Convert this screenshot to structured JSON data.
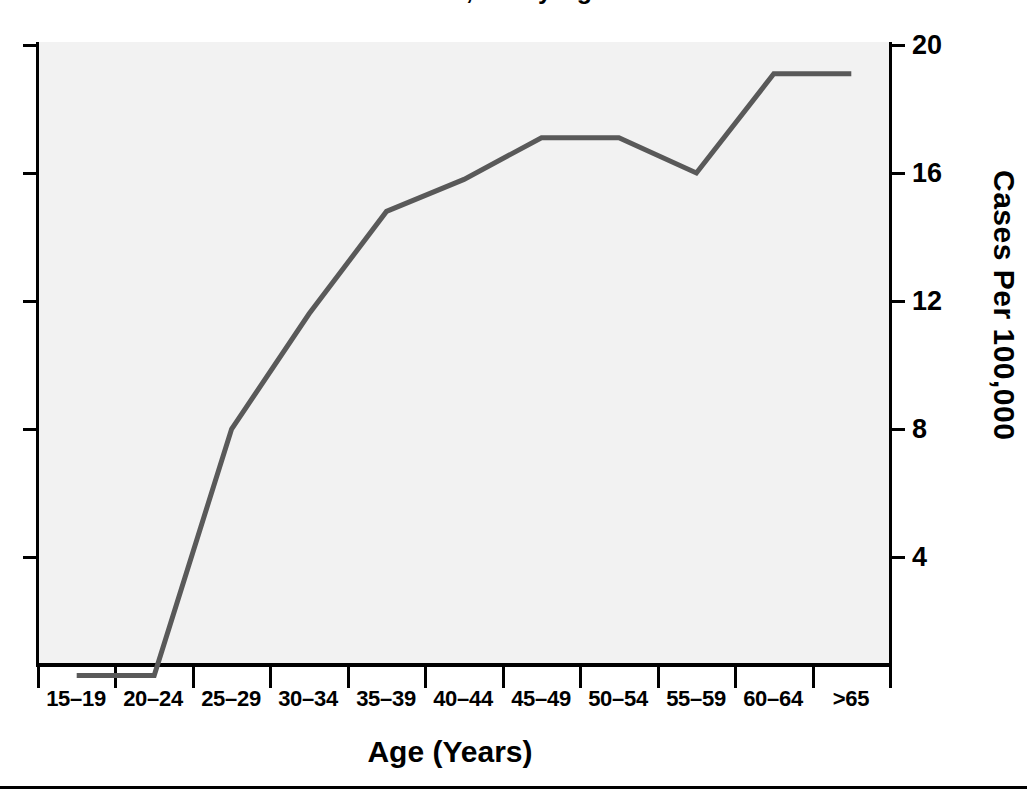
{
  "chart_data": {
    "type": "line",
    "title": "Cases Per 100,000 by Age",
    "xlabel": "Age (Years)",
    "ylabel": "Cases Per 100,000",
    "categories": [
      "15–19",
      "20–24",
      "25–29",
      "30–34",
      "35–39",
      "40–44",
      "45–49",
      "50–54",
      "55–59",
      "60–64",
      ">65"
    ],
    "values": [
      0.3,
      0.3,
      8.0,
      11.6,
      14.8,
      15.8,
      17.1,
      17.1,
      16.0,
      19.1,
      19.1
    ],
    "ylim": [
      0,
      20
    ],
    "yticks": [
      4,
      8,
      12,
      16,
      20
    ],
    "ytick_labels": [
      "4",
      "8",
      "12",
      "16",
      "20"
    ],
    "grid": false,
    "legend": "none",
    "series_color": "#595959",
    "plot_background": "#f2f2f2",
    "axis_color": "#000000",
    "line_width": 5
  },
  "axis": {
    "y_labels": [
      "20",
      "16",
      "12",
      "8",
      "4"
    ],
    "x_labels": [
      "15–19",
      "20–24",
      "25–29",
      "30–34",
      "35–39",
      "40–44",
      "45–49",
      "50–54",
      "55–59",
      "60–64",
      ">65"
    ]
  }
}
